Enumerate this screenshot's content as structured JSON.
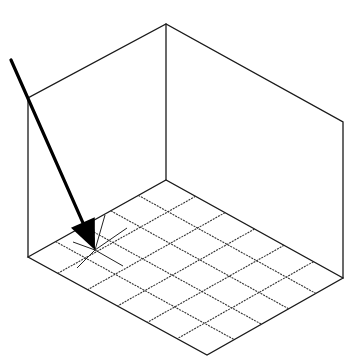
{
  "diagram": {
    "title": "",
    "colors": {
      "line": "#1a1a1a",
      "background": "#ffffff",
      "arrow": "#000000"
    },
    "room": {
      "floor_left": [
        28,
        257
      ],
      "floor_back": [
        166,
        180
      ],
      "floor_right": [
        343,
        278
      ],
      "floor_front": [
        207,
        355
      ],
      "wall_top_left": [
        28,
        98
      ],
      "wall_top_back": [
        166,
        24
      ],
      "wall_top_right": [
        343,
        122
      ]
    },
    "floor_grid": {
      "divisions_left_edge": 5,
      "divisions_right_edge": 6
    },
    "arrow": {
      "tail": [
        11,
        60
      ],
      "tip": [
        95,
        250
      ]
    },
    "target_point": [
      95,
      250
    ]
  }
}
